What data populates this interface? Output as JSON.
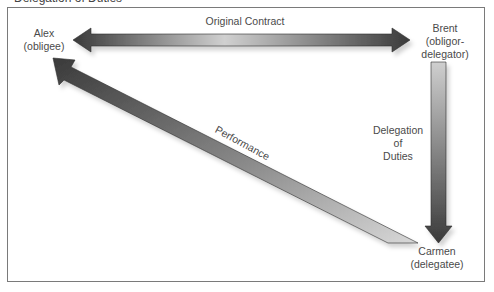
{
  "diagram": {
    "caption_fragment": "Delegation of Duties",
    "nodes": [
      {
        "id": "alex",
        "name": "Alex",
        "role": "(obligee)"
      },
      {
        "id": "brent",
        "name": "Brent",
        "role_line1": "(obligor-",
        "role_line2": "delegator)"
      },
      {
        "id": "carmen",
        "name": "Carmen",
        "role": "(delegatee)"
      }
    ],
    "edges": [
      {
        "from": "alex",
        "to": "brent",
        "label": "Original Contract",
        "direction": "bidirectional"
      },
      {
        "from": "brent",
        "to": "carmen",
        "label_line1": "Delegation",
        "label_line2": "of",
        "label_line3": "Duties",
        "direction": "forward"
      },
      {
        "from": "carmen",
        "to": "alex",
        "label": "Performance",
        "direction": "forward"
      }
    ],
    "colors": {
      "arrow_dark": "#3c3c3c",
      "arrow_light": "#d4d4d4",
      "frame": "#7a7a7a",
      "text": "#4a4a4a"
    }
  }
}
